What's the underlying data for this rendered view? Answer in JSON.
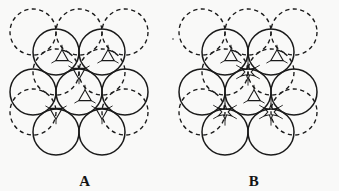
{
  "figure": {
    "width": 339,
    "height": 191,
    "background_color": "#f9f9f8",
    "ink_color": "#1a1a1a",
    "caption_font_style": "bold serif"
  },
  "panels": [
    {
      "id": "A",
      "label": "A",
      "description": "Close-packed layer pair with tetrahedral interstitial sites marked",
      "interstitial_marker": "triangle",
      "interstitial_count": 6,
      "solid_circle_count": 7,
      "dashed_circle_count": 7,
      "circle_radius": 23,
      "origin_x": 10,
      "origin_y": 12
    },
    {
      "id": "B",
      "label": "B",
      "description": "Close-packed layer pair with octahedral interstitial sites marked",
      "interstitial_marker": "star",
      "interstitial_count": 3,
      "secondary_marker": "triangle",
      "secondary_marker_count": 3,
      "solid_circle_count": 7,
      "dashed_circle_count": 7,
      "circle_radius": 23,
      "origin_x": 10,
      "origin_y": 12
    }
  ],
  "chart_data": {
    "type": "diagram",
    "title": "",
    "subtitle": "",
    "xlabel": "",
    "ylabel": "",
    "legend": [
      {
        "name": "front-layer-sphere",
        "style": "solid circle outline"
      },
      {
        "name": "back-layer-sphere",
        "style": "dashed circle outline"
      },
      {
        "name": "tetrahedral-hole",
        "style": "small triangle"
      },
      {
        "name": "octahedral-hole",
        "style": "small star"
      }
    ],
    "geometry": {
      "circle_radius": 23,
      "row_spacing": 40,
      "column_spacing": 46,
      "dashed_offset_x": 23,
      "dashed_offset_y": -20
    },
    "panel_a": {
      "solid_circles": [
        {
          "cx": 56,
          "cy": 52
        },
        {
          "cx": 102,
          "cy": 52
        },
        {
          "cx": 33,
          "cy": 92
        },
        {
          "cx": 79,
          "cy": 92
        },
        {
          "cx": 125,
          "cy": 92
        },
        {
          "cx": 56,
          "cy": 132
        },
        {
          "cx": 102,
          "cy": 132
        }
      ],
      "dashed_circles": [
        {
          "cx": 33,
          "cy": 32
        },
        {
          "cx": 79,
          "cy": 32
        },
        {
          "cx": 125,
          "cy": 32
        },
        {
          "cx": 56,
          "cy": 72
        },
        {
          "cx": 102,
          "cy": 72
        },
        {
          "cx": 33,
          "cy": 112
        },
        {
          "cx": 125,
          "cy": 112
        }
      ],
      "markers": [
        {
          "cx": 62,
          "cy": 57,
          "shape": "triangle",
          "rot": 0
        },
        {
          "cx": 108,
          "cy": 57,
          "shape": "triangle",
          "rot": 0
        },
        {
          "cx": 79,
          "cy": 72,
          "shape": "triangle",
          "rot": 180
        },
        {
          "cx": 85,
          "cy": 97,
          "shape": "triangle",
          "rot": 0
        },
        {
          "cx": 56,
          "cy": 112,
          "shape": "triangle",
          "rot": 180
        },
        {
          "cx": 102,
          "cy": 112,
          "shape": "triangle",
          "rot": 180
        }
      ]
    },
    "panel_b": {
      "solid_circles": [
        {
          "cx": 56,
          "cy": 52
        },
        {
          "cx": 102,
          "cy": 52
        },
        {
          "cx": 33,
          "cy": 92
        },
        {
          "cx": 79,
          "cy": 92
        },
        {
          "cx": 125,
          "cy": 92
        },
        {
          "cx": 56,
          "cy": 132
        },
        {
          "cx": 102,
          "cy": 132
        }
      ],
      "dashed_circles": [
        {
          "cx": 33,
          "cy": 32
        },
        {
          "cx": 79,
          "cy": 32
        },
        {
          "cx": 125,
          "cy": 32
        },
        {
          "cx": 56,
          "cy": 72
        },
        {
          "cx": 102,
          "cy": 72
        },
        {
          "cx": 33,
          "cy": 112
        },
        {
          "cx": 125,
          "cy": 112
        }
      ],
      "markers": [
        {
          "cx": 62,
          "cy": 57,
          "shape": "triangle",
          "rot": 0
        },
        {
          "cx": 108,
          "cy": 57,
          "shape": "triangle",
          "rot": 0
        },
        {
          "cx": 85,
          "cy": 97,
          "shape": "triangle",
          "rot": 0
        },
        {
          "cx": 79,
          "cy": 72,
          "shape": "star",
          "rot": 0
        },
        {
          "cx": 56,
          "cy": 112,
          "shape": "star",
          "rot": 0
        },
        {
          "cx": 102,
          "cy": 112,
          "shape": "star",
          "rot": 0
        }
      ]
    }
  },
  "artifacts": {
    "speck": {
      "x": 172,
      "y": 38
    }
  }
}
